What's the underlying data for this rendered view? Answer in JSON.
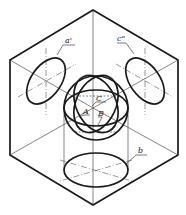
{
  "figure": {
    "labels": {
      "a_prime": "a'",
      "c_double_prime": "c\"",
      "C": "C",
      "A": "A",
      "B": "B",
      "b": "b"
    },
    "colors": {
      "line": "#1a1a1a",
      "background": "#ffffff"
    }
  }
}
